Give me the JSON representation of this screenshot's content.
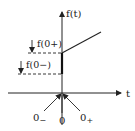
{
  "diagram": {
    "axes": {
      "y_label": "f(t)",
      "x_label": "t"
    },
    "levels": {
      "upper_label": "f(0+)",
      "lower_label": "f(0−)"
    },
    "time_markers": {
      "minus": "0",
      "minus_sub": "−",
      "zero": "0",
      "plus": "0",
      "plus_sub": "+"
    },
    "colors": {
      "ink": "#222222",
      "background": "#ffffff"
    }
  }
}
